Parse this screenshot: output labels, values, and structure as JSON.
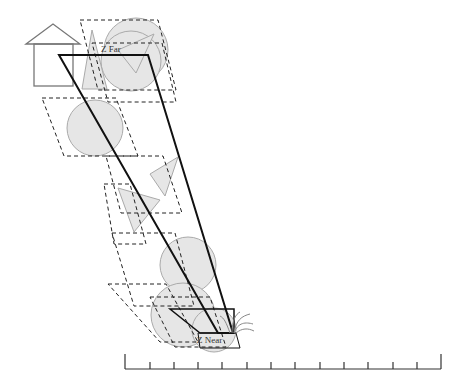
{
  "diagram": {
    "labels": {
      "z_far": "Z Far",
      "z_near": "Z Near"
    },
    "colors": {
      "shape_fill": "#e6e6e6",
      "shape_stroke": "#aaaaaa",
      "frustum": "#111111",
      "dashed": "#222222",
      "house": "#777777",
      "ruler": "#333333"
    },
    "ruler": {
      "ticks": 14
    }
  }
}
